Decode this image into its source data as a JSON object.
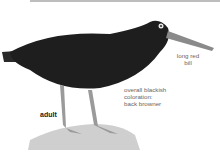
{
  "figure": {
    "labels": {
      "bill": "long red bill",
      "bill_line1": "long red",
      "bill_line2": "bill",
      "coloration_line1": "overall blackish",
      "coloration_line2": "coloration:",
      "coloration_line3": "back browner",
      "age": "adult"
    }
  }
}
